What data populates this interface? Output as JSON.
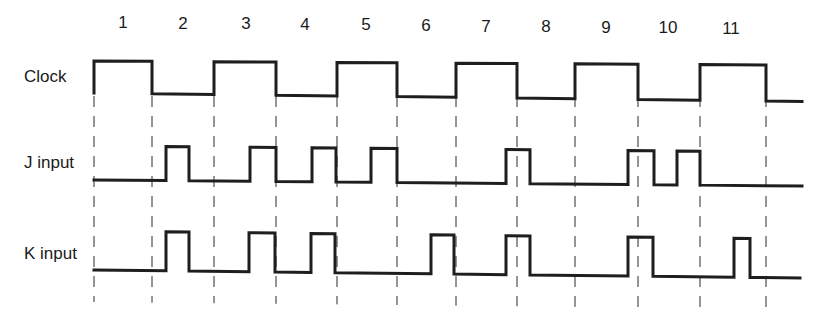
{
  "diagram": {
    "type": "timing-diagram",
    "period_labels": [
      "1",
      "2",
      "3",
      "4",
      "5",
      "6",
      "7",
      "8",
      "9",
      "10",
      "11"
    ],
    "period_label_x": [
      123,
      183,
      246,
      305,
      366,
      426,
      486,
      546,
      606,
      668,
      731
    ],
    "signals": [
      {
        "name": "Clock",
        "label_x": 24,
        "label_y": 82
      },
      {
        "name": "J input",
        "label_x": 24,
        "label_y": 168
      },
      {
        "name": "K input",
        "label_x": 24,
        "label_y": 259
      }
    ],
    "clock_edges_x": [
      94,
      152,
      214,
      276,
      337,
      397,
      456,
      517,
      575,
      638,
      700,
      766
    ],
    "guide_lines_x": [
      94,
      152,
      214,
      276,
      337,
      397,
      456,
      517,
      575,
      638,
      700,
      766
    ],
    "waveforms": {
      "clock": {
        "high_y": [
          61,
          65
        ],
        "low_y": [
          93,
          101
        ],
        "end_x": 802,
        "states": "1 0 1 0 1 0 1 0 1 0 1 0"
      },
      "j_input": {
        "high_y": 146,
        "low_y": 180,
        "start_x": 94,
        "end_x": 802,
        "pulses": [
          [
            166,
            189
          ],
          [
            250,
            276
          ],
          [
            312,
            336
          ],
          [
            371,
            397
          ],
          [
            506,
            530
          ],
          [
            628,
            654
          ],
          [
            677,
            700
          ]
        ]
      },
      "k_input": {
        "high_y": 231,
        "low_y": 270,
        "start_x": 94,
        "end_x": 800,
        "pulses": [
          [
            166,
            189
          ],
          [
            249,
            275
          ],
          [
            311,
            335
          ],
          [
            431,
            454
          ],
          [
            506,
            530
          ],
          [
            628,
            653
          ],
          [
            734,
            750
          ]
        ]
      }
    },
    "stroke_color": "#1e1e1e",
    "background_color": "#ffffff"
  }
}
